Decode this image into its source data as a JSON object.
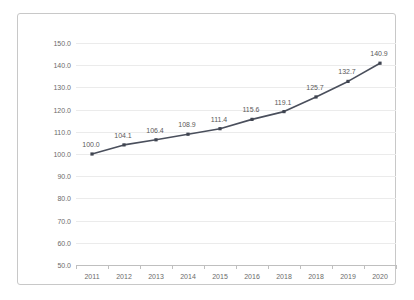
{
  "chart_data": {
    "type": "line",
    "title": "",
    "xlabel": "",
    "ylabel": "",
    "categories": [
      "2011",
      "2012",
      "2013",
      "2014",
      "2015",
      "2016",
      "2018",
      "2018",
      "2019",
      "2020"
    ],
    "values": [
      100.0,
      104.1,
      106.4,
      108.9,
      111.4,
      115.6,
      119.1,
      125.7,
      132.7,
      140.9
    ],
    "point_labels": [
      "100.0",
      "104.1",
      "106.4",
      "108.9",
      "111.4",
      "115.6",
      "119.1",
      "125.7",
      "132.7",
      "140.9"
    ],
    "ylim": [
      50.0,
      150.0
    ],
    "ytick_values": [
      150.0,
      140.0,
      130.0,
      120.0,
      110.0,
      100.0,
      90.0,
      80.0,
      70.0,
      60.0,
      50.0
    ],
    "ytick_labels": [
      "150.0",
      "140.0",
      "130.0",
      "120.0",
      "110.0",
      "100.0",
      "90.0",
      "80.0",
      "70.0",
      "60.0",
      "50.0"
    ],
    "grid": true,
    "legend": false,
    "series": [
      {
        "name": "",
        "values": [
          100.0,
          104.1,
          106.4,
          108.9,
          111.4,
          115.6,
          119.1,
          125.7,
          132.7,
          140.9
        ],
        "line_color": "#4a4f5c",
        "marker": "square",
        "marker_color": "#3f4450"
      }
    ]
  },
  "style": {
    "background": "#ffffff",
    "frame_border": "#c8c8c8",
    "gridline_color": "#ebebeb",
    "axis_color": "#bfbfbf",
    "tick_text_color": "#6b6b6b",
    "label_text_color": "#5a5a5a"
  }
}
